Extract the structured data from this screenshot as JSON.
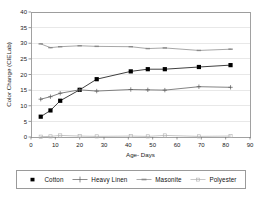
{
  "chart_data": {
    "type": "line",
    "title": "",
    "xlabel": "Age- Days",
    "ylabel": "Color Change (CIELab)",
    "xlim": [
      0,
      90
    ],
    "ylim": [
      0,
      40
    ],
    "xticks": [
      0,
      10,
      20,
      30,
      40,
      50,
      60,
      70,
      80,
      90
    ],
    "yticks": [
      0,
      5,
      10,
      15,
      20,
      25,
      30,
      35,
      40
    ],
    "grid": true,
    "legend_position": "below",
    "series": [
      {
        "name": "Cotton",
        "marker": "filled-square",
        "color": "#000000",
        "x": [
          4,
          8,
          12,
          20,
          27,
          41,
          48,
          55,
          69,
          82
        ],
        "y": [
          6.5,
          8.5,
          11.6,
          15.1,
          18.5,
          21.0,
          21.7,
          21.7,
          22.4,
          23.0
        ]
      },
      {
        "name": "Heavy Linen",
        "marker": "plus",
        "color": "#5a5a5a",
        "x": [
          4,
          8,
          12,
          20,
          27,
          41,
          48,
          55,
          69,
          82
        ],
        "y": [
          12.1,
          12.9,
          14.0,
          15.1,
          14.7,
          15.2,
          15.1,
          15.0,
          16.1,
          15.9
        ]
      },
      {
        "name": "Masonite",
        "marker": "dash",
        "color": "#8a8a8a",
        "x": [
          4,
          8,
          12,
          20,
          27,
          41,
          48,
          55,
          69,
          82
        ],
        "y": [
          29.8,
          28.6,
          28.9,
          29.2,
          29.0,
          28.9,
          28.3,
          28.5,
          27.7,
          28.1
        ]
      },
      {
        "name": "Polyester",
        "marker": "open-square",
        "color": "#b0b0b0",
        "x": [
          4,
          8,
          12,
          20,
          27,
          41,
          48,
          55,
          69,
          82
        ],
        "y": [
          0.1,
          0.2,
          0.5,
          0.3,
          0.2,
          0.3,
          0.2,
          0.5,
          0.2,
          0.3
        ]
      }
    ]
  },
  "legend": {
    "entries": [
      {
        "label": "Cotton"
      },
      {
        "label": "Heavy Linen"
      },
      {
        "label": "Masonite"
      },
      {
        "label": "Polyester"
      }
    ]
  }
}
